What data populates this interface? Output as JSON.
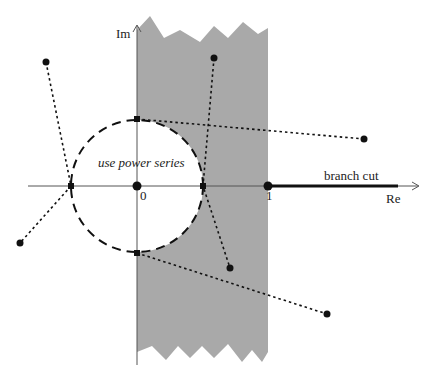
{
  "diagram": {
    "type": "complex-plane",
    "colors": {
      "shade": "#a9a9a9",
      "axis": "#555555",
      "ink": "#111111",
      "background": "#ffffff"
    },
    "axes": {
      "real_label": "Re",
      "imag_label": "Im",
      "origin_label": "0",
      "unit_label": "1",
      "origin_px": [
        137,
        186
      ],
      "unit_px": [
        268,
        186
      ]
    },
    "region": {
      "label": "use power series",
      "circle_center_px": [
        137,
        186
      ],
      "circle_radius_px": 66,
      "shaded_band": {
        "x_from": 137,
        "x_to": 268
      }
    },
    "branch_cut": {
      "label": "branch cut",
      "from_px": [
        268,
        186
      ],
      "to_px": [
        398,
        186
      ]
    },
    "points": [
      {
        "id": "p1",
        "px": [
          46,
          62
        ]
      },
      {
        "id": "p2",
        "px": [
          214,
          58
        ]
      },
      {
        "id": "p3",
        "px": [
          364,
          139
        ]
      },
      {
        "id": "p4",
        "px": [
          20,
          243
        ]
      },
      {
        "id": "p5",
        "px": [
          230,
          268
        ]
      },
      {
        "id": "p6",
        "px": [
          327,
          314
        ]
      }
    ],
    "mapping_paths": [
      {
        "points": [
          [
            46,
            62
          ],
          [
            71,
            186
          ],
          [
            20,
            243
          ]
        ]
      },
      {
        "points": [
          [
            214,
            58
          ],
          [
            203,
            186
          ],
          [
            230,
            268
          ]
        ]
      },
      {
        "points": [
          [
            137,
            119
          ],
          [
            364,
            139
          ]
        ]
      },
      {
        "points": [
          [
            137,
            253
          ],
          [
            327,
            314
          ]
        ]
      }
    ]
  }
}
